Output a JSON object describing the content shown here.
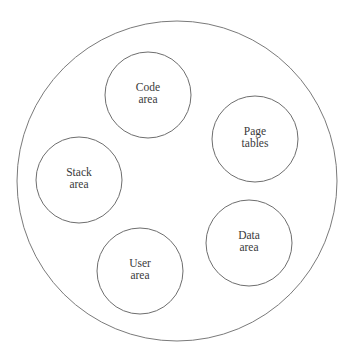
{
  "diagram": {
    "type": "process-address-space",
    "outer": {
      "name": "process",
      "cx": 177,
      "cy": 181,
      "r": 160,
      "stroke": "#7a7a7a"
    },
    "regions": [
      {
        "id": "code-area",
        "lines": [
          "Code",
          "area"
        ],
        "cx": 148,
        "cy": 95,
        "r": 43
      },
      {
        "id": "page-tables",
        "lines": [
          "Page",
          "tables"
        ],
        "cx": 255,
        "cy": 139,
        "r": 43
      },
      {
        "id": "stack-area",
        "lines": [
          "Stack",
          "area"
        ],
        "cx": 79,
        "cy": 180,
        "r": 43
      },
      {
        "id": "data-area",
        "lines": [
          "Data",
          "area"
        ],
        "cx": 249,
        "cy": 243,
        "r": 43
      },
      {
        "id": "user-area",
        "lines": [
          "User",
          "area"
        ],
        "cx": 140,
        "cy": 271,
        "r": 43
      }
    ],
    "colors": {
      "background": "#ffffff",
      "stroke": "#6e6e6e",
      "text": "#3a3a3a"
    }
  }
}
